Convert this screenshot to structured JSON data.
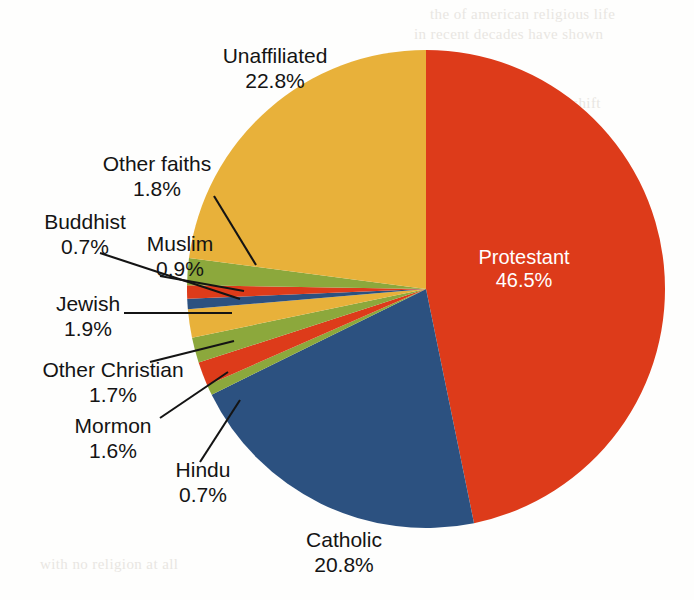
{
  "chart_data": {
    "type": "pie",
    "title": "",
    "units": "percent",
    "start_angle_deg": 0,
    "direction": "clockwise",
    "center": {
      "x": 426,
      "y": 289
    },
    "radius": 239,
    "total": 99.4,
    "categories": [
      "Protestant",
      "Catholic",
      "Hindu",
      "Mormon",
      "Other Christian",
      "Jewish",
      "Buddhist",
      "Muslim",
      "Other faiths",
      "Unaffiliated"
    ],
    "values": [
      46.5,
      20.8,
      0.7,
      1.6,
      1.7,
      1.9,
      0.7,
      0.9,
      1.8,
      22.8
    ],
    "slices": [
      {
        "label": "Protestant",
        "value": 46.5,
        "pct_text": "46.5%",
        "color": "#dd3b1a",
        "label_placement": "inside"
      },
      {
        "label": "Catholic",
        "value": 20.8,
        "pct_text": "20.8%",
        "color": "#2c5180",
        "label_placement": "outside"
      },
      {
        "label": "Hindu",
        "value": 0.7,
        "pct_text": "0.7%",
        "color": "#8ca83c",
        "label_placement": "leader"
      },
      {
        "label": "Mormon",
        "value": 1.6,
        "pct_text": "1.6%",
        "color": "#dd3b1a",
        "label_placement": "leader"
      },
      {
        "label": "Other Christian",
        "value": 1.7,
        "pct_text": "1.7%",
        "color": "#8ca83c",
        "label_placement": "leader"
      },
      {
        "label": "Jewish",
        "value": 1.9,
        "pct_text": "1.9%",
        "color": "#e8b13a",
        "label_placement": "leader"
      },
      {
        "label": "Buddhist",
        "value": 0.7,
        "pct_text": "0.7%",
        "color": "#2c5180",
        "label_placement": "leader"
      },
      {
        "label": "Muslim",
        "value": 0.9,
        "pct_text": "0.9%",
        "color": "#dd3b1a",
        "label_placement": "leader"
      },
      {
        "label": "Other faiths",
        "value": 1.8,
        "pct_text": "1.8%",
        "color": "#8ca83c",
        "label_placement": "leader"
      },
      {
        "label": "Unaffiliated",
        "value": 22.8,
        "pct_text": "22.8%",
        "color": "#e8b13a",
        "label_placement": "outside"
      }
    ],
    "palette": {
      "red": "#dd3b1a",
      "blue": "#2c5180",
      "gold": "#e8b13a",
      "green": "#8ca83c",
      "label_text": "#141414",
      "inside_label_text": "#ffffff",
      "background": "#fefefd"
    },
    "legend": "none",
    "grid": false
  },
  "labels": {
    "unaffiliated": {
      "name": "Unaffiliated",
      "pct": "22.8%"
    },
    "other_faiths": {
      "name": "Other faiths",
      "pct": "1.8%"
    },
    "buddhist": {
      "name": "Buddhist",
      "pct": "0.7%"
    },
    "muslim": {
      "name": "Muslim",
      "pct": "0.9%"
    },
    "jewish": {
      "name": "Jewish",
      "pct": "1.9%"
    },
    "other_christian": {
      "name": "Other Christian",
      "pct": "1.7%"
    },
    "mormon": {
      "name": "Mormon",
      "pct": "1.6%"
    },
    "hindu": {
      "name": "Hindu",
      "pct": "0.7%"
    },
    "catholic": {
      "name": "Catholic",
      "pct": "20.8%"
    },
    "protestant": {
      "name": "Protestant",
      "pct": "46.5%"
    }
  },
  "page_bleed": {
    "line1": "the of american religious life",
    "line2": "in recent decades have shown",
    "line3": "a steady and notable shift",
    "line4": "among those who identify",
    "line5": "with no religion at all"
  }
}
